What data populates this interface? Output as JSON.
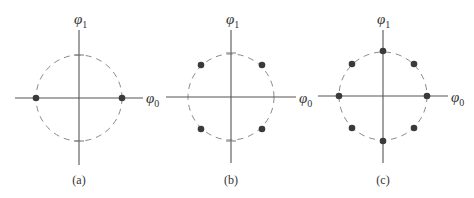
{
  "figure": {
    "colors": {
      "axis": "#555555",
      "circle": "#8a8a8a",
      "dot": "#3a3a3a",
      "text": "#333333"
    },
    "panels": [
      {
        "id": "a",
        "caption": "(a)",
        "x_axis_label": "φ",
        "x_axis_sub": "0",
        "y_axis_label": "φ",
        "y_axis_sub": "1",
        "center": [
          79,
          98
        ],
        "radius": 43,
        "constellation": "2-point (BPSK)",
        "points_deg": [
          0,
          180
        ]
      },
      {
        "id": "b",
        "caption": "(b)",
        "x_axis_label": "φ",
        "x_axis_sub": "0",
        "y_axis_label": "φ",
        "y_axis_sub": "1",
        "center": [
          231,
          97
        ],
        "radius": 43,
        "constellation": "4-point (QPSK)",
        "points_deg": [
          45,
          135,
          225,
          315
        ]
      },
      {
        "id": "c",
        "caption": "(c)",
        "x_axis_label": "φ",
        "x_axis_sub": "0",
        "y_axis_label": "φ",
        "y_axis_sub": "1",
        "center": [
          383,
          96
        ],
        "radius": 44,
        "constellation": "8-point (8-PSK)",
        "points_deg": [
          0,
          45,
          90,
          135,
          180,
          225,
          270,
          315
        ]
      }
    ]
  }
}
